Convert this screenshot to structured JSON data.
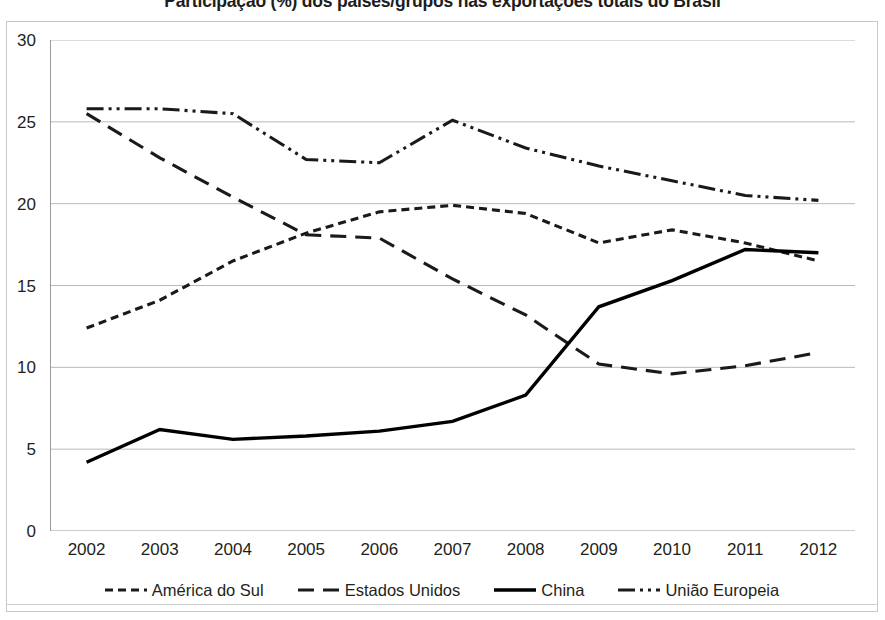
{
  "chart_data": {
    "type": "line",
    "title": "Participação (%) dos países/grupos nas exportações totais do Brasil",
    "xlabel": "",
    "ylabel": "",
    "categories": [
      "2002",
      "2003",
      "2004",
      "2005",
      "2006",
      "2007",
      "2008",
      "2009",
      "2010",
      "2011",
      "2012"
    ],
    "x": [
      2002,
      2003,
      2004,
      2005,
      2006,
      2007,
      2008,
      2009,
      2010,
      2011,
      2012
    ],
    "xlim": [
      2002,
      2012
    ],
    "ylim": [
      0,
      30
    ],
    "yticks": [
      0,
      5,
      10,
      15,
      20,
      25,
      30
    ],
    "ytick_labels": [
      "0",
      "5",
      "10",
      "15",
      "20",
      "25",
      "30"
    ],
    "grid": "horizontal",
    "legend_position": "bottom",
    "series": [
      {
        "name": "América do Sul",
        "style": "dotted",
        "color": "#1a1a1a",
        "values": [
          12.4,
          14.1,
          16.5,
          18.2,
          19.5,
          19.9,
          19.4,
          17.6,
          18.4,
          17.6,
          16.5
        ]
      },
      {
        "name": "Estados Unidos",
        "style": "dashed",
        "color": "#1a1a1a",
        "values": [
          25.5,
          22.8,
          20.4,
          18.1,
          17.9,
          15.4,
          13.2,
          10.2,
          9.6,
          10.1,
          10.9
        ]
      },
      {
        "name": "China",
        "style": "solid",
        "color": "#000000",
        "values": [
          4.2,
          6.2,
          5.6,
          5.8,
          6.1,
          6.7,
          8.3,
          13.7,
          15.3,
          17.2,
          17.0
        ]
      },
      {
        "name": "União Europeia",
        "style": "dash-dot-dot",
        "color": "#1a1a1a",
        "values": [
          25.8,
          25.8,
          25.5,
          22.7,
          22.5,
          25.1,
          23.4,
          22.3,
          21.4,
          20.5,
          20.2
        ]
      }
    ]
  },
  "legend": {
    "items": [
      {
        "label": "América do Sul",
        "swatch": "dotted-line-swatch"
      },
      {
        "label": "Estados Unidos",
        "swatch": "dashed-line-swatch"
      },
      {
        "label": "China",
        "swatch": "solid-line-swatch"
      },
      {
        "label": "União Europeia",
        "swatch": "dash-dot-dot-line-swatch"
      }
    ]
  }
}
